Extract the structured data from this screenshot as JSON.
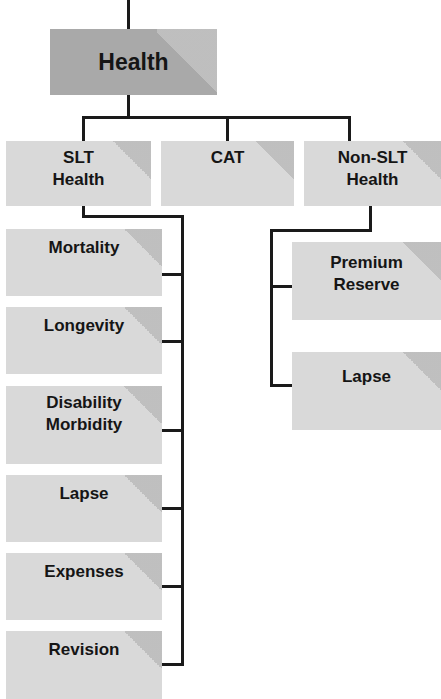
{
  "diagram": {
    "root": {
      "label": "Health"
    },
    "level2": [
      {
        "label": "SLT Health",
        "lines": [
          "SLT",
          "Health"
        ]
      },
      {
        "label": "CAT",
        "lines": [
          "CAT"
        ]
      },
      {
        "label": "Non-SLT Health",
        "lines": [
          "Non-SLT",
          "Health"
        ]
      }
    ],
    "slt_children": [
      {
        "lines": [
          "Mortality"
        ]
      },
      {
        "lines": [
          "Longevity"
        ]
      },
      {
        "lines": [
          "Disability",
          "Morbidity"
        ]
      },
      {
        "lines": [
          "Lapse"
        ]
      },
      {
        "lines": [
          "Expenses"
        ]
      },
      {
        "lines": [
          "Revision"
        ]
      }
    ],
    "non_slt_children": [
      {
        "lines": [
          "Premium",
          "Reserve"
        ]
      },
      {
        "lines": [
          "Lapse"
        ]
      }
    ],
    "colors": {
      "root_fill": "#a9a9a9",
      "node_fill": "#d9d9d9",
      "connector": "#1a1a1a",
      "text": "#151515"
    }
  }
}
